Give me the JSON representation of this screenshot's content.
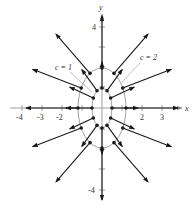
{
  "diagram": {
    "type": "vector_field_with_level_curves",
    "axes": {
      "x_label": "x",
      "y_label": "y",
      "x_ticks": [
        "-4",
        "-3",
        "-2",
        "2",
        "3"
      ],
      "y_ticks": [
        "4",
        "-4"
      ]
    },
    "curve_labels": [
      "c = 1",
      "c = 2"
    ],
    "colors": {
      "axis": "#888888",
      "curve": "#999999",
      "arrow": "#1a1a1a"
    }
  }
}
